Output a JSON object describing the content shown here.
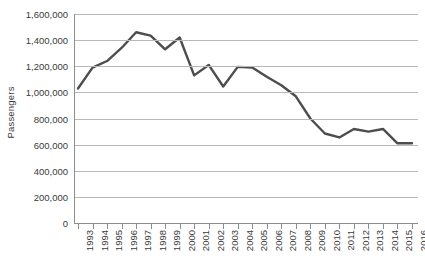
{
  "chart_data": {
    "type": "line",
    "title": "",
    "subtitle": "",
    "xlabel": "",
    "ylabel": "Passengers",
    "categories": [
      "1993",
      "1994",
      "1995",
      "1996",
      "1997",
      "1998",
      "1999",
      "2000",
      "2001",
      "2002",
      "2003",
      "2004",
      "2005",
      "2006",
      "2007",
      "2008",
      "2009",
      "2010",
      "2011",
      "2012",
      "2013",
      "2014",
      "2015",
      "2016"
    ],
    "values": [
      1030000,
      1190000,
      1240000,
      1340000,
      1460000,
      1435000,
      1330000,
      1420000,
      1130000,
      1210000,
      1045000,
      1195000,
      1190000,
      1120000,
      1055000,
      970000,
      800000,
      685000,
      655000,
      720000,
      700000,
      720000,
      610000,
      610000
    ],
    "series": [
      {
        "name": "Passengers",
        "values": [
          1030000,
          1190000,
          1240000,
          1340000,
          1460000,
          1435000,
          1330000,
          1420000,
          1130000,
          1210000,
          1045000,
          1195000,
          1190000,
          1120000,
          1055000,
          970000,
          800000,
          685000,
          655000,
          720000,
          700000,
          720000,
          610000,
          610000
        ],
        "color": "#4d4d4d"
      }
    ],
    "ylim": [
      0,
      1600000
    ],
    "ytick_values": [
      0,
      200000,
      400000,
      600000,
      800000,
      1000000,
      1200000,
      1400000,
      1600000
    ],
    "ytick_labels": [
      "0",
      "200,000",
      "400,000",
      "600,000",
      "800,000",
      "1,000,000",
      "1,200,000",
      "1,400,000",
      "1,600,000"
    ],
    "grid": true,
    "grid_axis": "y",
    "legend": false,
    "legend_position": "none",
    "line_color": "#4d4d4d",
    "gridline_color": "#b8b8b8",
    "axis_color": "#8d8d8d",
    "background_color": "#ffffff",
    "xtick_rotation": -90
  }
}
